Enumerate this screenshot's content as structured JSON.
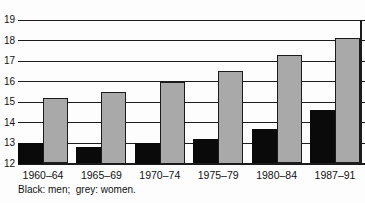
{
  "chart_data": {
    "type": "bar",
    "categories": [
      "1960–64",
      "1965–69",
      "1970–74",
      "1975–79",
      "1980–84",
      "1987–91"
    ],
    "series": [
      {
        "name": "men",
        "color": "#0a0a0a",
        "values": [
          13.0,
          12.8,
          13.0,
          13.2,
          13.7,
          14.6
        ]
      },
      {
        "name": "women",
        "color": "#a9a9a9",
        "values": [
          15.2,
          15.5,
          16.0,
          16.5,
          17.3,
          18.1
        ]
      }
    ],
    "title": "",
    "xlabel": "",
    "ylabel": "",
    "ylim": [
      12,
      19
    ],
    "yticks": [
      12,
      13,
      14,
      15,
      16,
      17,
      18,
      19
    ],
    "grid": true,
    "legend_position": "caption-below"
  },
  "caption": "Black: men;  grey: women.",
  "colors": {
    "background": "#fdfdfd",
    "grid": "#1c1c1c",
    "bar_men": "#0a0a0a",
    "bar_women": "#a9a9a9"
  }
}
